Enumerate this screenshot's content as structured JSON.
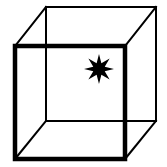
{
  "figure": {
    "name": "necker-cube-with-star",
    "width": 167,
    "height": 167,
    "background_color": "#ffffff",
    "line_color": "#000000",
    "star_color": "#000000"
  },
  "geometry": {
    "front_face": {
      "label": "front-square-face",
      "stroke_width": 4.5,
      "corners": {
        "top_left": {
          "x": 15,
          "y": 46
        },
        "top_right": {
          "x": 125,
          "y": 46
        },
        "bottom_right": {
          "x": 125,
          "y": 159
        },
        "bottom_left": {
          "x": 15,
          "y": 159
        }
      },
      "points": "15,46 125,46 125,159 15,159"
    },
    "back_face": {
      "label": "back-square-face",
      "stroke_width": 2.0,
      "corners": {
        "top_left": {
          "x": 46,
          "y": 7
        },
        "top_right": {
          "x": 156,
          "y": 7
        },
        "bottom_right": {
          "x": 156,
          "y": 121
        },
        "bottom_left": {
          "x": 46,
          "y": 121
        }
      },
      "points": "46,7 156,7 156,121 46,121"
    },
    "connectors": {
      "label": "depth-connecting-edges",
      "stroke_width": 2.0,
      "edges": [
        {
          "name": "top-left-connector",
          "x1": 15,
          "y1": 46,
          "x2": 46,
          "y2": 7
        },
        {
          "name": "top-right-connector",
          "x1": 125,
          "y1": 46,
          "x2": 156,
          "y2": 7
        },
        {
          "name": "bottom-right-connector",
          "x1": 125,
          "y1": 159,
          "x2": 156,
          "y2": 121
        },
        {
          "name": "bottom-left-connector",
          "x1": 15,
          "y1": 159,
          "x2": 46,
          "y2": 121
        }
      ]
    },
    "star": {
      "label": "eight-pointed-star",
      "points_count": 8,
      "center": {
        "x": 99,
        "y": 69
      },
      "outer_radius": 15,
      "inner_radius": 6.2,
      "rotation_degrees": 0,
      "polygon": "99.0,54.0 103.4,64.6 114.0,69.0 103.4,73.4 99.0,84.0 94.6,73.4 84.0,69.0 94.6,64.6"
    }
  },
  "labels": {
    "figure_caption": "",
    "alt_text": "Necker cube with an eight-pointed star inside"
  }
}
